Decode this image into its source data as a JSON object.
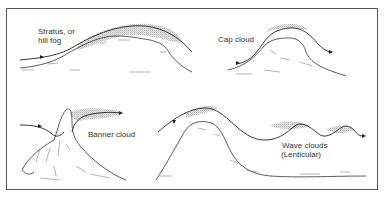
{
  "figure": {
    "panels": [
      {
        "id": "stratus",
        "label_lines": [
          "Stratus, or",
          "hill fog"
        ]
      },
      {
        "id": "cap",
        "label_lines": [
          "Cap cloud"
        ]
      },
      {
        "id": "banner",
        "label_lines": [
          "Banner cloud"
        ]
      },
      {
        "id": "wave",
        "label_lines": [
          "Wave clouds",
          "(Lenticular)"
        ]
      }
    ]
  },
  "colors": {
    "background": "#ffffff",
    "line": "#222222",
    "frame": "#555555",
    "cloud_stipple": "#bdbdbd",
    "text": "#333333"
  }
}
